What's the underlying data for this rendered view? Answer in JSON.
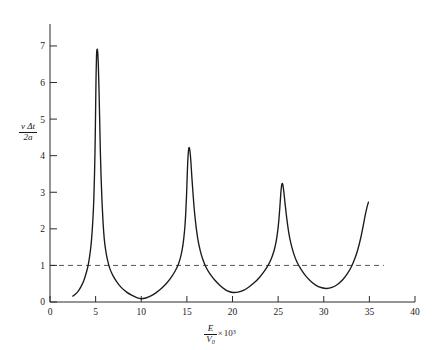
{
  "figure": {
    "background_color": "#ffffff",
    "curve_color": "#1a1a1a",
    "axis_color": "#2a2a2a",
    "reference_line_color": "#555555"
  },
  "axes": {
    "x": {
      "label_parts": {
        "numerator": "E",
        "denominator": "V",
        "denominator_sub": "0",
        "times": "×",
        "base": "10",
        "exponent": "3"
      },
      "ticks": [
        "0",
        "5",
        "10",
        "15",
        "20",
        "25",
        "30",
        "35",
        "40"
      ],
      "tick_values": [
        0,
        5,
        10,
        15,
        20,
        25,
        30,
        35,
        40
      ],
      "min": 0,
      "max": 40
    },
    "y": {
      "label_parts": {
        "numerator_v": "v",
        "numerator_delta": "Δt",
        "denominator": "2a"
      },
      "ticks": [
        "0",
        "1",
        "2",
        "3",
        "4",
        "5",
        "6",
        "7"
      ],
      "tick_values": [
        0,
        1,
        2,
        3,
        4,
        5,
        6,
        7
      ],
      "min": 0,
      "max": 7.6
    }
  },
  "reference_line": {
    "name": "unity-level",
    "y_value": 1,
    "x_start": 0,
    "x_end": 36.6,
    "style": "dashed"
  },
  "chart_data": {
    "type": "line",
    "title": "",
    "xlabel": "E/V0 × 10^3",
    "ylabel": "v Δt / 2a",
    "xlim": [
      0,
      40
    ],
    "ylim": [
      0,
      7.6
    ],
    "grid": false,
    "legend": null,
    "annotations": [
      {
        "text": "dashed reference line at y = 1",
        "y": 1
      }
    ],
    "series": [
      {
        "name": "vΔt/2a vs E/V0",
        "points": [
          [
            2.5,
            0.16
          ],
          [
            2.8,
            0.22
          ],
          [
            3.1,
            0.3
          ],
          [
            3.4,
            0.42
          ],
          [
            3.7,
            0.58
          ],
          [
            4.0,
            0.82
          ],
          [
            4.2,
            1.03
          ],
          [
            4.4,
            1.35
          ],
          [
            4.55,
            1.7
          ],
          [
            4.7,
            2.25
          ],
          [
            4.8,
            2.8
          ],
          [
            4.88,
            3.5
          ],
          [
            4.95,
            4.4
          ],
          [
            5.0,
            5.3
          ],
          [
            5.05,
            6.2
          ],
          [
            5.1,
            6.75
          ],
          [
            5.15,
            6.9
          ],
          [
            5.22,
            6.85
          ],
          [
            5.3,
            6.45
          ],
          [
            5.38,
            5.7
          ],
          [
            5.45,
            4.9
          ],
          [
            5.52,
            4.1
          ],
          [
            5.6,
            3.4
          ],
          [
            5.7,
            2.75
          ],
          [
            5.82,
            2.15
          ],
          [
            5.95,
            1.72
          ],
          [
            6.1,
            1.42
          ],
          [
            6.3,
            1.15
          ],
          [
            6.55,
            0.92
          ],
          [
            6.9,
            0.72
          ],
          [
            7.3,
            0.56
          ],
          [
            7.8,
            0.4
          ],
          [
            8.4,
            0.27
          ],
          [
            9.0,
            0.18
          ],
          [
            9.5,
            0.12
          ],
          [
            10.0,
            0.09
          ],
          [
            10.5,
            0.11
          ],
          [
            11.0,
            0.16
          ],
          [
            11.6,
            0.25
          ],
          [
            12.2,
            0.37
          ],
          [
            12.8,
            0.52
          ],
          [
            13.3,
            0.68
          ],
          [
            13.7,
            0.84
          ],
          [
            14.05,
            1.02
          ],
          [
            14.3,
            1.22
          ],
          [
            14.5,
            1.45
          ],
          [
            14.65,
            1.72
          ],
          [
            14.78,
            2.05
          ],
          [
            14.88,
            2.45
          ],
          [
            14.96,
            2.9
          ],
          [
            15.03,
            3.4
          ],
          [
            15.1,
            3.85
          ],
          [
            15.18,
            4.15
          ],
          [
            15.26,
            4.22
          ],
          [
            15.35,
            4.1
          ],
          [
            15.45,
            3.8
          ],
          [
            15.55,
            3.4
          ],
          [
            15.68,
            2.95
          ],
          [
            15.82,
            2.5
          ],
          [
            16.0,
            2.08
          ],
          [
            16.2,
            1.72
          ],
          [
            16.45,
            1.42
          ],
          [
            16.75,
            1.16
          ],
          [
            17.1,
            0.95
          ],
          [
            17.55,
            0.76
          ],
          [
            18.05,
            0.6
          ],
          [
            18.6,
            0.46
          ],
          [
            19.2,
            0.34
          ],
          [
            19.7,
            0.28
          ],
          [
            20.1,
            0.26
          ],
          [
            20.6,
            0.27
          ],
          [
            21.2,
            0.32
          ],
          [
            21.8,
            0.41
          ],
          [
            22.4,
            0.53
          ],
          [
            22.95,
            0.67
          ],
          [
            23.45,
            0.83
          ],
          [
            23.9,
            1.0
          ],
          [
            24.25,
            1.18
          ],
          [
            24.55,
            1.4
          ],
          [
            24.78,
            1.65
          ],
          [
            24.96,
            1.95
          ],
          [
            25.1,
            2.3
          ],
          [
            25.22,
            2.7
          ],
          [
            25.32,
            3.05
          ],
          [
            25.42,
            3.23
          ],
          [
            25.52,
            3.2
          ],
          [
            25.64,
            2.98
          ],
          [
            25.78,
            2.65
          ],
          [
            25.95,
            2.28
          ],
          [
            26.15,
            1.92
          ],
          [
            26.4,
            1.6
          ],
          [
            26.7,
            1.33
          ],
          [
            27.05,
            1.1
          ],
          [
            27.5,
            0.9
          ],
          [
            28.0,
            0.72
          ],
          [
            28.6,
            0.56
          ],
          [
            29.2,
            0.45
          ],
          [
            29.8,
            0.39
          ],
          [
            30.3,
            0.37
          ],
          [
            30.9,
            0.4
          ],
          [
            31.5,
            0.48
          ],
          [
            32.05,
            0.6
          ],
          [
            32.55,
            0.76
          ],
          [
            33.0,
            0.95
          ],
          [
            33.4,
            1.18
          ],
          [
            33.75,
            1.45
          ],
          [
            34.05,
            1.75
          ],
          [
            34.32,
            2.08
          ],
          [
            34.55,
            2.38
          ],
          [
            34.75,
            2.6
          ],
          [
            34.9,
            2.73
          ]
        ],
        "peaks": [
          {
            "x": 5.15,
            "y": 6.9
          },
          {
            "x": 15.26,
            "y": 4.22
          },
          {
            "x": 25.42,
            "y": 3.23
          }
        ],
        "minima": [
          {
            "x": 10.0,
            "y": 0.09
          },
          {
            "x": 20.1,
            "y": 0.26
          },
          {
            "x": 30.3,
            "y": 0.37
          }
        ]
      }
    ]
  }
}
